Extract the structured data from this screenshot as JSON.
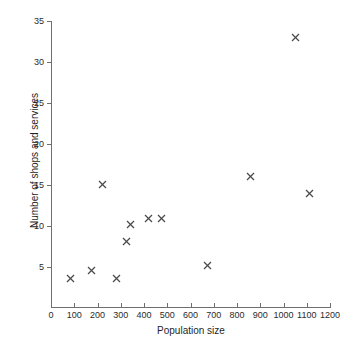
{
  "chart_data": {
    "type": "scatter",
    "title": "",
    "xlabel": "Population size",
    "ylabel": "Number of shops and services",
    "xlim": [
      0,
      1200
    ],
    "ylim": [
      0,
      35
    ],
    "grid": false,
    "legend": null,
    "marker": "x",
    "marker_color": "#4a4a4a",
    "xticks": [
      0,
      100,
      200,
      300,
      400,
      500,
      600,
      700,
      800,
      900,
      1000,
      1100,
      1200
    ],
    "xticklabels": [
      "0",
      "100",
      "200",
      "300",
      "400",
      "500",
      "600",
      "700",
      "800",
      "900",
      "1000",
      "1100",
      "1200"
    ],
    "yticks": [
      5,
      10,
      15,
      20,
      25,
      30,
      35
    ],
    "yticklabels": [
      "5",
      "10",
      "15",
      "20",
      "25",
      "30",
      "35"
    ],
    "points": [
      {
        "x": 85,
        "y": 3.6
      },
      {
        "x": 175,
        "y": 4.6
      },
      {
        "x": 280,
        "y": 3.6
      },
      {
        "x": 220,
        "y": 15.1
      },
      {
        "x": 325,
        "y": 8.1
      },
      {
        "x": 340,
        "y": 10.2
      },
      {
        "x": 420,
        "y": 10.9
      },
      {
        "x": 475,
        "y": 10.9
      },
      {
        "x": 675,
        "y": 5.2
      },
      {
        "x": 860,
        "y": 16.0
      },
      {
        "x": 1050,
        "y": 33.0
      },
      {
        "x": 1110,
        "y": 14.0
      }
    ],
    "x_series": [
      85,
      175,
      280,
      220,
      325,
      340,
      420,
      475,
      675,
      860,
      1050,
      1110
    ],
    "y_series": [
      3.6,
      4.6,
      3.6,
      15.1,
      8.1,
      10.2,
      10.9,
      10.9,
      5.2,
      16.0,
      33.0,
      14.0
    ]
  }
}
